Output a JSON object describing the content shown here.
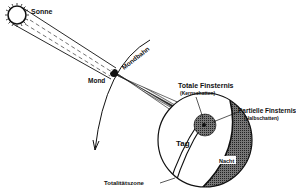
{
  "diagram": {
    "labels": {
      "sun": "Sonne",
      "moon": "Mond",
      "moon_orbit": "Mondbahn",
      "total_eclipse": "Totale Finsternis",
      "umbra": "(Kernschatten)",
      "partial_eclipse": "Partielle Finsternis",
      "penumbra": "(Halbschatten)",
      "day": "Tag",
      "night": "Nacht",
      "totality_zone": "Totalitätszone"
    },
    "colors": {
      "ink": "#111111",
      "background": "#ffffff",
      "night_shade": "#555555"
    }
  }
}
